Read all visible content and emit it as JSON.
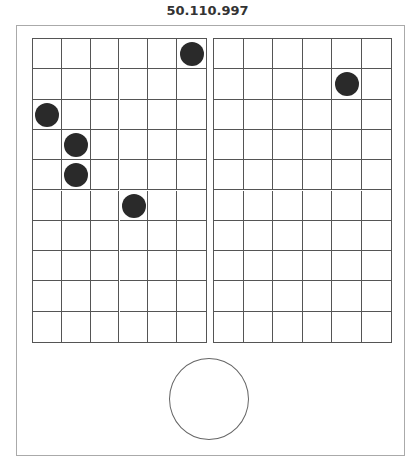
{
  "header": {
    "title": "50.110.997"
  },
  "colors": {
    "dot": "#2a2a2a",
    "grid_line": "#555555",
    "frame": "#aaaaaa"
  },
  "boards": [
    {
      "name": "left-board",
      "cols": 6,
      "rows": 10,
      "dots": [
        {
          "col": 5,
          "row": 0
        },
        {
          "col": 0,
          "row": 2
        },
        {
          "col": 1,
          "row": 3
        },
        {
          "col": 1,
          "row": 4
        },
        {
          "col": 3,
          "row": 5
        }
      ]
    },
    {
      "name": "right-board",
      "cols": 6,
      "rows": 10,
      "dots": [
        {
          "col": 4,
          "row": 1
        }
      ]
    }
  ],
  "action_button": {
    "shape": "circle",
    "label": ""
  }
}
